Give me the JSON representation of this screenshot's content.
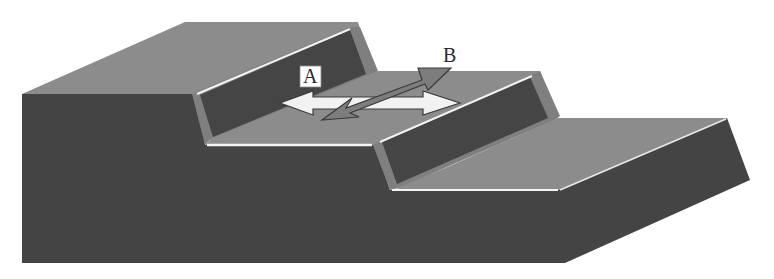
{
  "diagram": {
    "title": "",
    "labels": {
      "a": "A",
      "b": "B"
    },
    "arrows": [
      {
        "id": "A",
        "style": "white double-headed horizontal arrow",
        "direction": "along the terrace"
      },
      {
        "id": "B",
        "style": "grey double-headed oblique arrow",
        "direction": "across the terrace"
      }
    ],
    "colors": {
      "face_dark": "#444444",
      "surface_mid": "#8c8c8c",
      "scarp_light": "#7a7a7a",
      "highlight": "#f4f4f4",
      "arrow_a": "#f2f2f2",
      "arrow_b": "#7d7d7d",
      "outline": "#3a3a3a"
    }
  }
}
